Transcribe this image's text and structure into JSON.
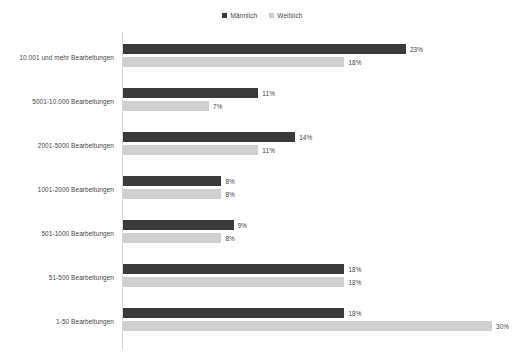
{
  "legend": {
    "position": "top-center",
    "entries": [
      {
        "label": "Männlich",
        "color": "#3a3a3a",
        "icon": "square-swatch-icon"
      },
      {
        "label": "Weiblich",
        "color": "#d0d0d0",
        "icon": "square-swatch-icon"
      }
    ]
  },
  "chart_data": {
    "type": "bar",
    "orientation": "horizontal",
    "title": "",
    "subtitle": "",
    "xlabel": "",
    "ylabel": "",
    "grid": false,
    "legend_position": "top-center",
    "xlim": [
      0,
      30
    ],
    "value_suffix": "%",
    "categories": [
      "10.001 und mehr Bearbeitungen",
      "5001-10.000 Bearbeitungen",
      "2001-5000 Bearbeitungen",
      "1001-2000 Bearbeitungen",
      "501-1000 Bearbeitungen",
      "51-500 Bearbeitungen",
      "1-50 Bearbeitungen"
    ],
    "series": [
      {
        "name": "Männlich",
        "color": "#3a3a3a",
        "values": [
          23,
          11,
          14,
          8,
          9,
          18,
          18
        ],
        "labels": [
          "23%",
          "11%",
          "14%",
          "8%",
          "9%",
          "18%",
          "18%"
        ]
      },
      {
        "name": "Weiblich",
        "color": "#d0d0d0",
        "values": [
          18,
          7,
          11,
          8,
          8,
          18,
          30
        ],
        "labels": [
          "18%",
          "7%",
          "11%",
          "8%",
          "8%",
          "18%",
          "30%"
        ]
      }
    ]
  }
}
